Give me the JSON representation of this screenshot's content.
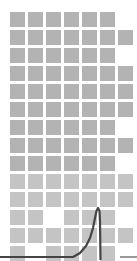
{
  "diagram": {
    "title": "",
    "grid": {
      "origin_x": 10,
      "origin_y": 12,
      "pitch": 18,
      "cell_size": 15,
      "columns": 7,
      "rows": 14,
      "cell_color": "#b3b3b3",
      "cell_color_light": "#c4c4c4",
      "present": [
        [
          1,
          1,
          1,
          1,
          1,
          1,
          0
        ],
        [
          1,
          1,
          1,
          1,
          1,
          1,
          1
        ],
        [
          1,
          1,
          1,
          1,
          1,
          1,
          0
        ],
        [
          1,
          1,
          1,
          1,
          1,
          1,
          1
        ],
        [
          1,
          1,
          1,
          1,
          1,
          1,
          1
        ],
        [
          1,
          1,
          1,
          1,
          1,
          1,
          1
        ],
        [
          1,
          1,
          1,
          1,
          1,
          1,
          0
        ],
        [
          1,
          1,
          1,
          1,
          1,
          1,
          1
        ],
        [
          1,
          1,
          1,
          1,
          1,
          1,
          0
        ],
        [
          1,
          1,
          1,
          1,
          1,
          1,
          1
        ],
        [
          1,
          1,
          1,
          1,
          1,
          1,
          1
        ],
        [
          1,
          1,
          0,
          1,
          1,
          1,
          0
        ],
        [
          1,
          1,
          1,
          1,
          1,
          1,
          1
        ],
        [
          1,
          0,
          1,
          1,
          1,
          1,
          0
        ]
      ]
    },
    "curve": {
      "description": "Flat baseline rising exponentially to a sharp peak, then a vertical drop",
      "color": "#444444",
      "stroke_width": 2.2,
      "points": [
        [
          0,
          257
        ],
        [
          73,
          257
        ],
        [
          80,
          253
        ],
        [
          86,
          246
        ],
        [
          90,
          238
        ],
        [
          93,
          228
        ],
        [
          95,
          218
        ],
        [
          96.5,
          211
        ],
        [
          98,
          208
        ],
        [
          99.5,
          211
        ],
        [
          100,
          222
        ],
        [
          100.5,
          260
        ]
      ]
    },
    "tick_line": {
      "color": "#555555",
      "x1": 120,
      "x2": 137,
      "y": 257
    }
  }
}
